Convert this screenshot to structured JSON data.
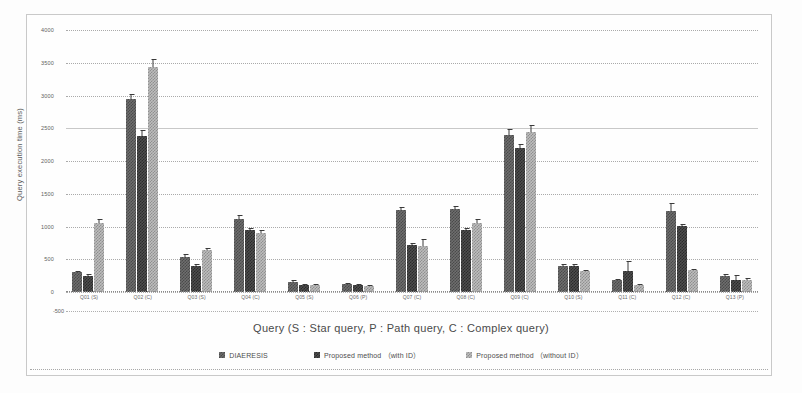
{
  "chart_data": {
    "type": "bar",
    "title": "",
    "xlabel": "Query (S : Star query,  P : Path query,  C : Complex query)",
    "ylabel": "Query execution time (ms)",
    "ylim": [
      -500,
      4000
    ],
    "yticks": [
      4000,
      3500,
      3000,
      2500,
      2000,
      1500,
      1000,
      500,
      0
    ],
    "ytick_below": "-500",
    "grid": true,
    "legend_position": "bottom",
    "categories": [
      "Q01 (S)",
      "Q02 (C)",
      "Q03 (S)",
      "Q04 (C)",
      "Q05 (S)",
      "Q06 (P)",
      "Q07 (C)",
      "Q08 (C)",
      "Q09 (C)",
      "Q10 (S)",
      "Q11 (C)",
      "Q12 (C)",
      "Q13 (P)"
    ],
    "series": [
      {
        "name": "DIAERESIS",
        "color": "#6e6e6e",
        "values": [
          300,
          2950,
          540,
          1120,
          160,
          125,
          1250,
          1265,
          2390,
          400,
          180,
          1230,
          250
        ],
        "errors": [
          25,
          70,
          45,
          60,
          20,
          15,
          55,
          50,
          95,
          25,
          20,
          130,
          25
        ]
      },
      {
        "name": "Proposed method （with ID）",
        "color": "#4e4e4e",
        "values": [
          250,
          2380,
          400,
          940,
          110,
          110,
          720,
          940,
          2200,
          400,
          320,
          1010,
          180
        ],
        "errors": [
          20,
          90,
          25,
          45,
          15,
          12,
          30,
          40,
          60,
          25,
          150,
          30,
          85
        ]
      },
      {
        "name": "Proposed method （without ID）",
        "color": "#bdbdbd",
        "values": [
          1060,
          3430,
          640,
          900,
          105,
          95,
          710,
          1060,
          2440,
          320,
          110,
          330,
          190
        ],
        "errors": [
          55,
          120,
          30,
          40,
          12,
          10,
          95,
          60,
          110,
          20,
          12,
          25,
          30
        ]
      }
    ]
  },
  "legend": {
    "items": [
      {
        "label": "DIAERESIS"
      },
      {
        "label": "Proposed method （with ID）"
      },
      {
        "label": "Proposed method （without ID）"
      }
    ]
  }
}
